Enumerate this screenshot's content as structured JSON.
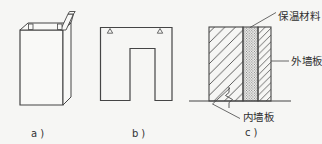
{
  "diagram": {
    "panels": [
      {
        "id": "a",
        "caption": "a)"
      },
      {
        "id": "b",
        "caption": "b)"
      },
      {
        "id": "c",
        "caption": "c)"
      }
    ],
    "annotations": {
      "insulation": "保温材料",
      "exterior_wall_panel": "外墙板",
      "interior_wall_panel": "内墙板"
    },
    "colors": {
      "paper": "#f6f6f4",
      "ink": "#454545",
      "text": "#2f2f2f"
    }
  }
}
